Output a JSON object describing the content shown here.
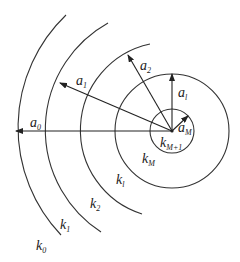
{
  "diagram": {
    "center": [
      172,
      131
    ],
    "colors": {
      "stroke": "#333333",
      "text": "#222222",
      "background": "#ffffff"
    },
    "radii_labels": [
      {
        "id": "a0",
        "main": "a",
        "sub": "0"
      },
      {
        "id": "a1",
        "main": "a",
        "sub": "1"
      },
      {
        "id": "a2",
        "main": "a",
        "sub": "2"
      },
      {
        "id": "al",
        "main": "a",
        "sub": "l"
      },
      {
        "id": "aM",
        "main": "a",
        "sub": "M"
      }
    ],
    "region_labels": [
      {
        "id": "k0",
        "main": "k",
        "sub": "0"
      },
      {
        "id": "k1",
        "main": "k",
        "sub": "1"
      },
      {
        "id": "k2",
        "main": "k",
        "sub": "2"
      },
      {
        "id": "kl",
        "main": "k",
        "sub": "l"
      },
      {
        "id": "kM",
        "main": "k",
        "sub": "M"
      },
      {
        "id": "kM1",
        "main": "k",
        "sub": "M+1"
      }
    ]
  }
}
